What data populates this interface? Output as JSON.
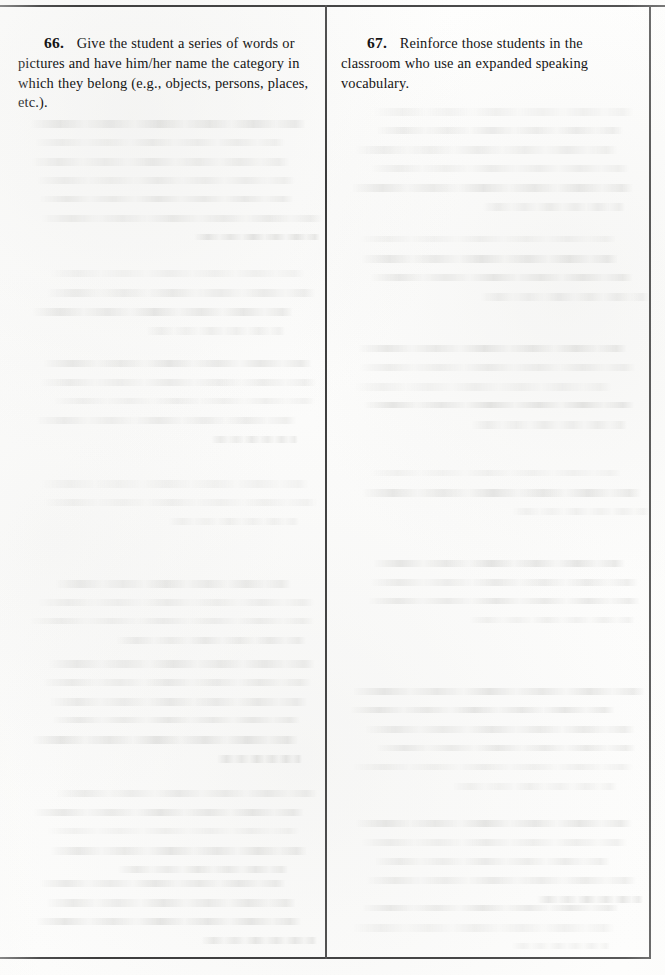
{
  "page": {
    "background_color": "#fdfdfc",
    "ink_color": "#151515",
    "rule_color": "#4c4c4c",
    "width": 665,
    "height": 975
  },
  "columns": {
    "left": {
      "item": {
        "number": "66.",
        "text": "Give the student a series of words or pictures and have him/her name the category in which they belong (e.g., objects, persons, places, etc.)."
      }
    },
    "right": {
      "item": {
        "number": "67.",
        "text": "Reinforce those students in the classroom who use an expanded speaking vocabulary."
      }
    }
  }
}
